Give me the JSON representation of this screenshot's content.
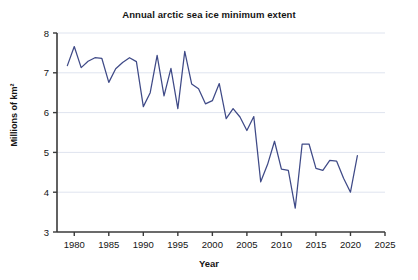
{
  "chart_data": {
    "type": "line",
    "title": "Annual arctic sea ice minimum extent",
    "xlabel": "Year",
    "ylabel": "Millions of km²",
    "xlim": [
      1977.5,
      2025
    ],
    "ylim": [
      3,
      8
    ],
    "xticks": [
      1980,
      1985,
      1990,
      1995,
      2000,
      2005,
      2010,
      2015,
      2020,
      2025
    ],
    "yticks": [
      3,
      4,
      5,
      6,
      7,
      8
    ],
    "grid": "horizontal",
    "legend": "none",
    "line_color": "#3f4a87",
    "x": [
      1979,
      1980,
      1981,
      1982,
      1983,
      1984,
      1985,
      1986,
      1987,
      1988,
      1989,
      1990,
      1991,
      1992,
      1993,
      1994,
      1995,
      1996,
      1997,
      1998,
      1999,
      2000,
      2001,
      2002,
      2003,
      2004,
      2005,
      2006,
      2007,
      2008,
      2009,
      2010,
      2011,
      2012,
      2013,
      2014,
      2015,
      2016,
      2017,
      2018,
      2019,
      2020,
      2021
    ],
    "values": [
      7.18,
      7.66,
      7.13,
      7.29,
      7.38,
      7.36,
      6.76,
      7.1,
      7.26,
      7.38,
      7.28,
      6.15,
      6.5,
      7.44,
      6.42,
      7.11,
      6.1,
      7.54,
      6.72,
      6.6,
      6.22,
      6.3,
      6.73,
      5.85,
      6.1,
      5.89,
      5.55,
      5.9,
      4.26,
      4.7,
      5.28,
      4.58,
      4.55,
      3.6,
      5.21,
      5.21,
      4.6,
      4.55,
      4.8,
      4.78,
      4.35,
      4.0,
      4.92
    ],
    "series_name": "Arctic sea ice minimum extent"
  }
}
